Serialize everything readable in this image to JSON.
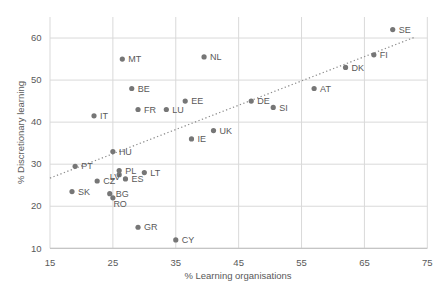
{
  "chart_data": {
    "type": "scatter",
    "title": "",
    "xlabel": "% Learning organisations",
    "ylabel": "% Discretionary learning",
    "xlim": [
      15,
      75
    ],
    "ylim": [
      10,
      65
    ],
    "x_ticks": [
      15,
      25,
      35,
      45,
      55,
      65,
      75
    ],
    "y_ticks": [
      10,
      20,
      30,
      40,
      50,
      60
    ],
    "grid": true,
    "legend": "none",
    "point_color": "#767676",
    "text_color": "#595959",
    "grid_color": "#d9d9d9",
    "axis_line_color": "#bfbfbf",
    "trendline": {
      "style": "dotted",
      "color": "#8c8c8c",
      "x1": 15,
      "y1": 26.7,
      "x2": 73,
      "y2": 60.2
    },
    "points": [
      {
        "label": "SE",
        "x": 69.5,
        "y": 62
      },
      {
        "label": "FI",
        "x": 66.5,
        "y": 56
      },
      {
        "label": "DK",
        "x": 62,
        "y": 53
      },
      {
        "label": "NL",
        "x": 39.5,
        "y": 55.5
      },
      {
        "label": "MT",
        "x": 26.5,
        "y": 55
      },
      {
        "label": "AT",
        "x": 57,
        "y": 48
      },
      {
        "label": "BE",
        "x": 28,
        "y": 48
      },
      {
        "label": "DE",
        "x": 47,
        "y": 45
      },
      {
        "label": "EE",
        "x": 36.5,
        "y": 45
      },
      {
        "label": "SI",
        "x": 50.5,
        "y": 43.5
      },
      {
        "label": "LU",
        "x": 33.5,
        "y": 43
      },
      {
        "label": "FR",
        "x": 29,
        "y": 43
      },
      {
        "label": "IT",
        "x": 22,
        "y": 41.5
      },
      {
        "label": "UK",
        "x": 41,
        "y": 38
      },
      {
        "label": "IE",
        "x": 37.5,
        "y": 36
      },
      {
        "label": "HU",
        "x": 25,
        "y": 33
      },
      {
        "label": "PT",
        "x": 19,
        "y": 29.5
      },
      {
        "label": "PL",
        "x": 26,
        "y": 28.5
      },
      {
        "label": "LT",
        "x": 30,
        "y": 28
      },
      {
        "label": "LV",
        "x": 26,
        "y": 27.5,
        "label_anchor": "end",
        "label_dx": 1,
        "label_dy": 5.5
      },
      {
        "label": "ES",
        "x": 27,
        "y": 26.5
      },
      {
        "label": "CZ",
        "x": 22.5,
        "y": 26
      },
      {
        "label": "SK",
        "x": 18.5,
        "y": 23.5
      },
      {
        "label": "BG",
        "x": 24.5,
        "y": 23
      },
      {
        "label": "RO",
        "x": 25,
        "y": 22,
        "label_dx": 0.5,
        "label_dy": 9.5
      },
      {
        "label": "GR",
        "x": 29,
        "y": 15
      },
      {
        "label": "CY",
        "x": 35,
        "y": 12
      }
    ]
  }
}
